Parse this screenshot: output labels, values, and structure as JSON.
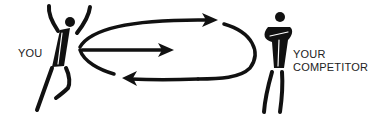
{
  "diagram": {
    "left_figure": {
      "label": "YOU",
      "pose": "arms-raised"
    },
    "right_figure": {
      "label_line1": "YOUR",
      "label_line2": "COMPETITOR",
      "pose": "arms-crossed"
    },
    "arrows": [
      {
        "name": "top-arc-arrow",
        "direction": "toward-competitor"
      },
      {
        "name": "middle-straight-arrow",
        "direction": "toward-competitor"
      },
      {
        "name": "bottom-arc-arrow",
        "direction": "toward-you"
      }
    ],
    "colors": {
      "ink": "#111111",
      "background": "#ffffff",
      "text": "#222222"
    }
  }
}
